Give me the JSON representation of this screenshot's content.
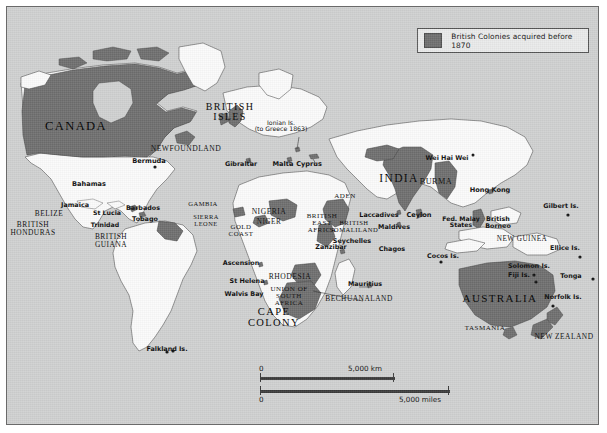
{
  "map": {
    "title_present": false,
    "colors": {
      "ocean": "#cfd0d0",
      "land": "#fbfbfb",
      "colony_fill": "#6e6e6e",
      "coastline": "#3a3a3a",
      "frame": "#6a6a6a",
      "legend_bg": "#e9eaea",
      "text": "#0b0b0b"
    }
  },
  "legend": {
    "swatch_color": "#6e6e6e",
    "label": "British Colonies acquired before 1870"
  },
  "scale": {
    "km": {
      "zero": "0",
      "value": "5,000 km"
    },
    "miles": {
      "zero": "0",
      "value": "5,000 miles"
    }
  },
  "labels": [
    {
      "id": "canada",
      "text": "CANADA",
      "x": 75,
      "y": 119,
      "style": "major",
      "size": 12.5
    },
    {
      "id": "newfoundland",
      "text": "NEWFOUNDLAND",
      "x": 185,
      "y": 144,
      "style": "region",
      "size": 7.6
    },
    {
      "id": "bermuda",
      "text": "Bermuda",
      "x": 148,
      "y": 157,
      "style": "point",
      "size": 6.6
    },
    {
      "id": "bahamas",
      "text": "Bahamas",
      "x": 88,
      "y": 180,
      "style": "point",
      "size": 6.6
    },
    {
      "id": "jamaica",
      "text": "Jamaica",
      "x": 74,
      "y": 201,
      "style": "point",
      "size": 6.4
    },
    {
      "id": "belize",
      "text": "BELIZE",
      "x": 48,
      "y": 209,
      "style": "region",
      "size": 7.4
    },
    {
      "id": "british-honduras",
      "text": "BRITISH\nHONDURAS",
      "x": 32,
      "y": 220,
      "style": "region",
      "size": 7.4
    },
    {
      "id": "st-lucia",
      "text": "St Lucia",
      "x": 106,
      "y": 209,
      "style": "point",
      "size": 6.2
    },
    {
      "id": "trinidad",
      "text": "Trinidad",
      "x": 104,
      "y": 221,
      "style": "point",
      "size": 6.2
    },
    {
      "id": "barbados",
      "text": "Barbados",
      "x": 142,
      "y": 204,
      "style": "point",
      "size": 6.4
    },
    {
      "id": "tobago",
      "text": "Tobago",
      "x": 144,
      "y": 215,
      "style": "point",
      "size": 6.4
    },
    {
      "id": "british-guiana",
      "text": "BRITISH\nGUIANA",
      "x": 110,
      "y": 232,
      "style": "region",
      "size": 7.4
    },
    {
      "id": "falkland-is",
      "text": "Falkland Is.",
      "x": 166,
      "y": 345,
      "style": "point",
      "size": 6.4
    },
    {
      "id": "british-isles",
      "text": "BRITISH\nISLES",
      "x": 229,
      "y": 101,
      "style": "major",
      "size": 10.0
    },
    {
      "id": "ionian-is",
      "text": "Ionian Is.\n(to Greece 1863)",
      "x": 280,
      "y": 119,
      "style": "note",
      "size": 6.2
    },
    {
      "id": "gibraltar",
      "text": "Gibraltar",
      "x": 240,
      "y": 160,
      "style": "point",
      "size": 6.4
    },
    {
      "id": "malta",
      "text": "Malta",
      "x": 282,
      "y": 160,
      "style": "point",
      "size": 6.6
    },
    {
      "id": "cyprus",
      "text": "Cyprus",
      "x": 308,
      "y": 160,
      "style": "point",
      "size": 6.6
    },
    {
      "id": "gambia",
      "text": "GAMBIA",
      "x": 202,
      "y": 200,
      "style": "region",
      "size": 6.6
    },
    {
      "id": "sierra-leone",
      "text": "SIERRA\nLEONE",
      "x": 205,
      "y": 213,
      "style": "region",
      "size": 6.4
    },
    {
      "id": "gold-coast",
      "text": "GOLD\nCOAST",
      "x": 240,
      "y": 223,
      "style": "region",
      "size": 6.8
    },
    {
      "id": "nigeria",
      "text": "NIGERIA",
      "x": 268,
      "y": 207,
      "style": "region",
      "size": 7.6
    },
    {
      "id": "niger",
      "text": "NIGER",
      "x": 268,
      "y": 218,
      "style": "region",
      "size": 7.2
    },
    {
      "id": "aden",
      "text": "ADEN",
      "x": 344,
      "y": 192,
      "style": "region",
      "size": 7.0
    },
    {
      "id": "british-east-africa",
      "text": "BRITISH\nEAST\nAFRICA",
      "x": 321,
      "y": 212,
      "style": "region",
      "size": 7.0
    },
    {
      "id": "british-somaliland",
      "text": "BRITISH\nSOMALILAND",
      "x": 353,
      "y": 219,
      "style": "region",
      "size": 6.6
    },
    {
      "id": "zanzibar",
      "text": "Zanzibar",
      "x": 330,
      "y": 243,
      "style": "point",
      "size": 6.4
    },
    {
      "id": "seychelles",
      "text": "Seychelles",
      "x": 351,
      "y": 237,
      "style": "point",
      "size": 6.4
    },
    {
      "id": "ascension",
      "text": "Ascension",
      "x": 240,
      "y": 259,
      "style": "point",
      "size": 6.4
    },
    {
      "id": "st-helena",
      "text": "St Helena",
      "x": 246,
      "y": 277,
      "style": "point",
      "size": 6.4
    },
    {
      "id": "walvis-bay",
      "text": "Walvis Bay",
      "x": 243,
      "y": 290,
      "style": "point",
      "size": 6.4
    },
    {
      "id": "rhodesia",
      "text": "RHODESIA",
      "x": 289,
      "y": 272,
      "style": "region",
      "size": 7.6
    },
    {
      "id": "union-south-africa",
      "text": "UNION OF\nSOUTH\nAFRICA",
      "x": 288,
      "y": 285,
      "style": "region",
      "size": 7.0
    },
    {
      "id": "bechuanaland",
      "text": "BECHUANALAND",
      "x": 358,
      "y": 294,
      "style": "region",
      "size": 7.4
    },
    {
      "id": "mauritius",
      "text": "Mauritius",
      "x": 364,
      "y": 280,
      "style": "point",
      "size": 6.4
    },
    {
      "id": "cape-colony",
      "text": "CAPE\nCOLONY",
      "x": 273,
      "y": 306,
      "style": "major",
      "size": 10.5
    },
    {
      "id": "india",
      "text": "INDIA",
      "x": 398,
      "y": 172,
      "style": "major",
      "size": 11.5
    },
    {
      "id": "burma",
      "text": "BURMA",
      "x": 435,
      "y": 177,
      "style": "region",
      "size": 8.2
    },
    {
      "id": "wei-hai-wei",
      "text": "Wei Hai Wei",
      "x": 446,
      "y": 154,
      "style": "point",
      "size": 6.4
    },
    {
      "id": "hong-kong",
      "text": "Hong Kong",
      "x": 489,
      "y": 186,
      "style": "point",
      "size": 6.6
    },
    {
      "id": "laccadives",
      "text": "Laccadives",
      "x": 378,
      "y": 211,
      "style": "point",
      "size": 6.4
    },
    {
      "id": "ceylon",
      "text": "Ceylon",
      "x": 418,
      "y": 211,
      "style": "point",
      "size": 6.6
    },
    {
      "id": "maldives",
      "text": "Maldives",
      "x": 393,
      "y": 223,
      "style": "point",
      "size": 6.4
    },
    {
      "id": "chagos",
      "text": "Chagos",
      "x": 391,
      "y": 245,
      "style": "point",
      "size": 6.4
    },
    {
      "id": "cocos-is",
      "text": "Cocos Is.",
      "x": 442,
      "y": 252,
      "style": "point",
      "size": 6.4
    },
    {
      "id": "fed-malay-states",
      "text": "Fed. Malay\nStates",
      "x": 460,
      "y": 215,
      "style": "point",
      "size": 6.2
    },
    {
      "id": "british-borneo",
      "text": "British\nBorneo",
      "x": 497,
      "y": 215,
      "style": "point",
      "size": 6.4
    },
    {
      "id": "new-guinea",
      "text": "NEW GUINEA",
      "x": 521,
      "y": 235,
      "style": "region",
      "size": 7.2
    },
    {
      "id": "gilbert-is",
      "text": "Gilbert Is.",
      "x": 560,
      "y": 202,
      "style": "point",
      "size": 6.4
    },
    {
      "id": "ellice-is",
      "text": "Ellice Is.",
      "x": 564,
      "y": 244,
      "style": "point",
      "size": 6.4
    },
    {
      "id": "solomon-is",
      "text": "Solomon Is.",
      "x": 528,
      "y": 262,
      "style": "point",
      "size": 6.4
    },
    {
      "id": "fiji-is",
      "text": "Fiji Is.",
      "x": 518,
      "y": 271,
      "style": "point",
      "size": 6.4
    },
    {
      "id": "tonga",
      "text": "Tonga",
      "x": 570,
      "y": 272,
      "style": "point",
      "size": 6.4
    },
    {
      "id": "norfolk-is",
      "text": "Norfolk Is.",
      "x": 562,
      "y": 293,
      "style": "point",
      "size": 6.4
    },
    {
      "id": "australia",
      "text": "AUSTRALIA",
      "x": 499,
      "y": 292,
      "style": "major",
      "size": 11.0
    },
    {
      "id": "tasmania",
      "text": "TASMANIA",
      "x": 484,
      "y": 324,
      "style": "region",
      "size": 7.0
    },
    {
      "id": "new-zealand",
      "text": "NEW ZEALAND",
      "x": 563,
      "y": 332,
      "style": "region",
      "size": 7.4
    }
  ]
}
